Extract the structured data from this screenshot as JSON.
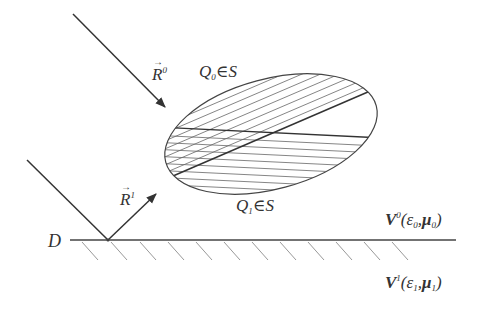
{
  "diagram": {
    "colors": {
      "line": "#333333",
      "hatch": "#555555",
      "ground_hatch": "#888888",
      "background": "#ffffff"
    },
    "labels": {
      "incident_vector": {
        "symbol": "R",
        "superscript": "0"
      },
      "reflected_vector": {
        "symbol": "R",
        "superscript": "1"
      },
      "upper_point": {
        "symbol": "Q",
        "subscript": "0",
        "relation": "∈",
        "set": "S"
      },
      "lower_point": {
        "symbol": "Q",
        "subscript": "1",
        "relation": "∈",
        "set": "S"
      },
      "boundary": "D",
      "medium_upper": {
        "symbol": "V",
        "superscript": "0",
        "open": "(",
        "eps": "ε",
        "eps_sub": "0",
        "sep": ",",
        "mu": "μ",
        "mu_sub": "0",
        "close": ")"
      },
      "medium_lower": {
        "symbol": "V",
        "superscript": "1",
        "open": "(",
        "eps": "ε",
        "eps_sub": "1",
        "sep": ",",
        "mu": "μ",
        "mu_sub": "1",
        "close": ")"
      }
    },
    "elements": [
      "incident-ray-arrow",
      "reflected-ray-arrow",
      "incident-line-to-ground",
      "ellipse-region-S",
      "diagonal-hatch-upper",
      "horizontal-hatch-lower",
      "ground-line-D",
      "ground-hatching"
    ]
  }
}
